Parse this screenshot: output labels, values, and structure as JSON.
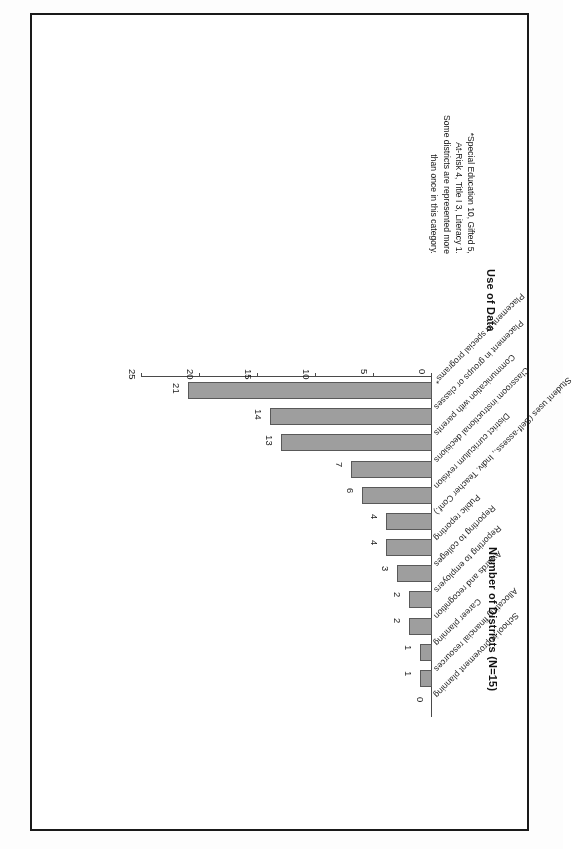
{
  "figure": {
    "y_axis_title": "Number of Districts (N=15)",
    "x_axis_title": "Use of Data",
    "footnote_lines": [
      "*Special Education 10, Gifted 5,",
      "At-Risk 4, Title I 3, Literacy 1.",
      "Some districts are represented more",
      "than once in this category."
    ],
    "bar_color": "#9e9e9e",
    "bar_border_color": "#595959",
    "axis_color": "#4a4a4a"
  },
  "chart_data": {
    "type": "bar",
    "orientation": "horizontal",
    "title": "",
    "xlabel": "Use of Data",
    "ylabel": "Number of Districts (N=15)",
    "ylim": [
      0,
      25
    ],
    "ticks": [
      "0",
      "5",
      "10",
      "15",
      "20",
      "25"
    ],
    "tick_values": [
      0,
      5,
      10,
      15,
      20,
      25
    ],
    "grid": false,
    "legend": false,
    "categories": [
      "Placement in special programs*",
      "Placement in groups or classes",
      "Communication with parents",
      "Classroom instructional decisions",
      "District curriculum revision",
      "Student uses (Self-assess., Indiv. Teacher Conf.)",
      "Public reporting",
      "Reporting to colleges",
      "Reporting to employers",
      "Awards and recognition",
      "Career planning",
      "Allocating financial resources",
      "School improvement planning"
    ],
    "values": [
      21,
      14,
      13,
      7,
      6,
      4,
      4,
      3,
      2,
      2,
      1,
      1,
      0
    ],
    "data_labels": [
      "21",
      "14",
      "13",
      "7",
      "6",
      "4",
      "4",
      "3",
      "2",
      "2",
      "1",
      "1",
      "0"
    ]
  }
}
